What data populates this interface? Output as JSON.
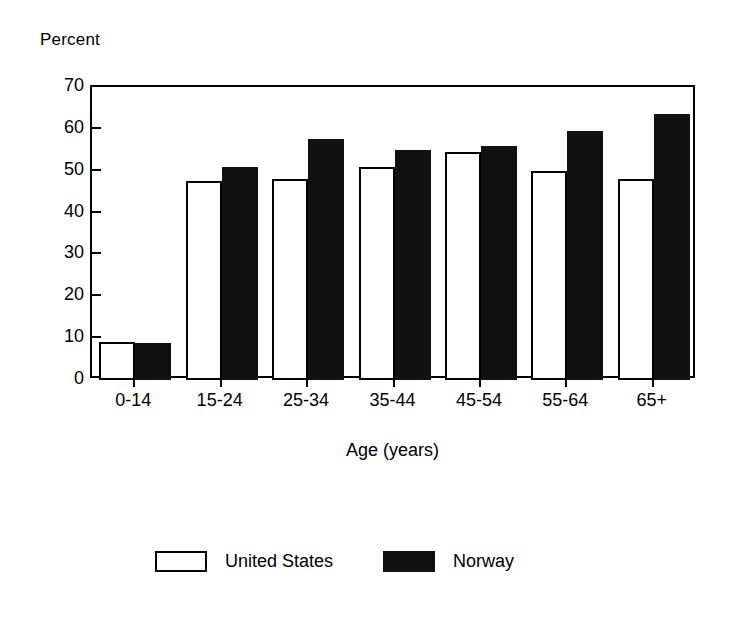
{
  "chart_data": {
    "type": "bar",
    "title": "",
    "ylabel": "Percent",
    "xlabel": "Age (years)",
    "categories": [
      "0-14",
      "15-24",
      "25-34",
      "35-44",
      "45-54",
      "55-64",
      "65+"
    ],
    "series": [
      {
        "name": "United States",
        "values": [
          9,
          47.5,
          48,
          51,
          54.5,
          50,
          48
        ]
      },
      {
        "name": "Norway",
        "values": [
          8.8,
          51,
          57.5,
          55,
          56,
          59.5,
          63.5
        ]
      }
    ],
    "ylim": [
      0,
      70
    ],
    "ytick_labels": [
      "0",
      "10",
      "20",
      "30",
      "40",
      "50",
      "60",
      "70"
    ],
    "ytick_values": [
      0,
      10,
      20,
      30,
      40,
      50,
      60,
      70
    ],
    "grid": false,
    "legend_position": "bottom",
    "colors": {
      "united_states": "#ffffff",
      "norway": "#111111",
      "axis": "#000000",
      "background": "#ffffff"
    }
  },
  "legend": {
    "entries": [
      {
        "label": "United States",
        "swatch": "open-white-rect"
      },
      {
        "label": "Norway",
        "swatch": "filled-black-rect"
      }
    ]
  }
}
